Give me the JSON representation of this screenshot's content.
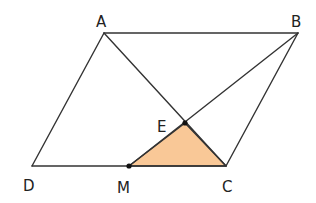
{
  "diagram": {
    "colors": {
      "line": "#333333",
      "shade_fill": "#F9C897",
      "label": "#222222",
      "point": "#111111"
    },
    "points": {
      "A": {
        "label": "A",
        "x": 104,
        "y": 33
      },
      "B": {
        "label": "B",
        "x": 298,
        "y": 33
      },
      "C": {
        "label": "C",
        "x": 226,
        "y": 166
      },
      "D": {
        "label": "D",
        "x": 32,
        "y": 166
      },
      "E": {
        "label": "E",
        "x": 185,
        "y": 123
      },
      "M": {
        "label": "M",
        "x": 129,
        "y": 166
      }
    },
    "segments": [
      [
        "A",
        "B"
      ],
      [
        "B",
        "C"
      ],
      [
        "C",
        "D"
      ],
      [
        "D",
        "A"
      ],
      [
        "A",
        "C"
      ],
      [
        "B",
        "M"
      ]
    ],
    "shaded_region": {
      "vertices": [
        "E",
        "M",
        "C"
      ],
      "fill": "#F9C897"
    },
    "marked_points": [
      "E",
      "M"
    ]
  }
}
